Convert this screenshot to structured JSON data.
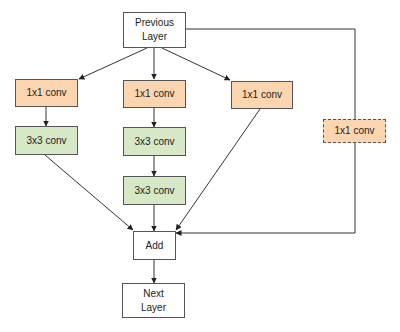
{
  "diagram": {
    "type": "flowchart",
    "title": "",
    "colors": {
      "conv1x1": "#fad5b0",
      "conv3x3": "#d7e8c6",
      "plain": "#ffffff",
      "border": "#555555"
    },
    "nodes": {
      "previous_layer": {
        "label": "Previous Layer",
        "line1": "Previous",
        "line2": "Layer"
      },
      "b1_conv1x1": {
        "label": "1x1 conv"
      },
      "b1_conv3x3": {
        "label": "3x3 conv"
      },
      "b2_conv1x1": {
        "label": "1x1 conv"
      },
      "b2_conv3x3_a": {
        "label": "3x3 conv"
      },
      "b2_conv3x3_b": {
        "label": "3x3 conv"
      },
      "b3_conv1x1": {
        "label": "1x1 conv"
      },
      "shortcut_conv1x1": {
        "label": "1x1 conv",
        "style": "dashed"
      },
      "add": {
        "label": "Add"
      },
      "next_layer": {
        "label": "Next Layer",
        "line1": "Next",
        "line2": "Layer"
      }
    },
    "edges": [
      [
        "previous_layer",
        "b1_conv1x1"
      ],
      [
        "previous_layer",
        "b2_conv1x1"
      ],
      [
        "previous_layer",
        "b3_conv1x1"
      ],
      [
        "previous_layer",
        "shortcut_conv1x1"
      ],
      [
        "b1_conv1x1",
        "b1_conv3x3"
      ],
      [
        "b2_conv1x1",
        "b2_conv3x3_a"
      ],
      [
        "b2_conv3x3_a",
        "b2_conv3x3_b"
      ],
      [
        "b1_conv3x3",
        "add"
      ],
      [
        "b2_conv3x3_b",
        "add"
      ],
      [
        "b3_conv1x1",
        "add"
      ],
      [
        "shortcut_conv1x1",
        "add"
      ],
      [
        "add",
        "next_layer"
      ]
    ]
  }
}
